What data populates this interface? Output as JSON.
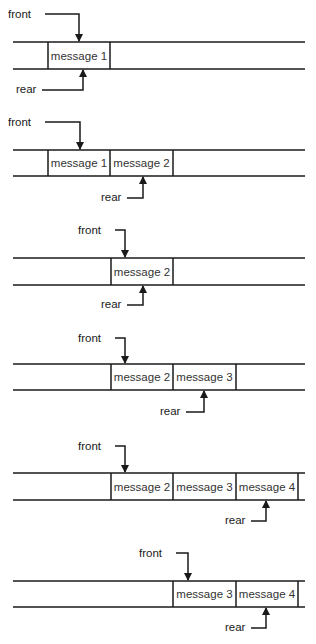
{
  "diagram": {
    "title": "",
    "line_color": "#1a1a1a",
    "labels": {
      "front": "front",
      "rear": "rear"
    },
    "track": {
      "x_start": 13,
      "x_end": 305,
      "cell_width": 62,
      "cells_x": [
        48,
        110,
        173,
        236,
        298
      ]
    },
    "panels": [
      {
        "id": 1,
        "top": 42,
        "bottom": 69,
        "messages": [
          {
            "text": "message 1",
            "x0": 48,
            "x1": 110
          }
        ],
        "front": {
          "label_x": 8,
          "label_y": 18,
          "arrow_x": 79
        },
        "rear": {
          "label_x": 16,
          "label_y": 93,
          "arrow_x": 83
        },
        "right_cap": false
      },
      {
        "id": 2,
        "top": 150,
        "bottom": 176,
        "messages": [
          {
            "text": "message 1",
            "x0": 48,
            "x1": 110
          },
          {
            "text": "message 2",
            "x0": 110,
            "x1": 173
          }
        ],
        "front": {
          "label_x": 8,
          "label_y": 126,
          "arrow_x": 80
        },
        "rear": {
          "label_x": 101,
          "label_y": 201,
          "arrow_x": 143
        },
        "right_cap": false
      },
      {
        "id": 3,
        "top": 258,
        "bottom": 285,
        "messages": [
          {
            "text": "message 2",
            "x0": 111,
            "x1": 173
          }
        ],
        "front": {
          "label_x": 78,
          "label_y": 234,
          "arrow_x": 125
        },
        "rear": {
          "label_x": 101,
          "label_y": 308,
          "arrow_x": 143
        },
        "right_cap": false
      },
      {
        "id": 4,
        "top": 364,
        "bottom": 390,
        "messages": [
          {
            "text": "message 2",
            "x0": 111,
            "x1": 173
          },
          {
            "text": "message 3",
            "x0": 173,
            "x1": 236
          }
        ],
        "front": {
          "label_x": 78,
          "label_y": 342,
          "arrow_x": 125
        },
        "rear": {
          "label_x": 160,
          "label_y": 415,
          "arrow_x": 204
        },
        "right_cap": false
      },
      {
        "id": 5,
        "top": 473,
        "bottom": 500,
        "messages": [
          {
            "text": "message 2",
            "x0": 111,
            "x1": 173
          },
          {
            "text": "message 3",
            "x0": 173,
            "x1": 236
          },
          {
            "text": "message 4",
            "x0": 236,
            "x1": 298
          }
        ],
        "front": {
          "label_x": 78,
          "label_y": 450,
          "arrow_x": 125
        },
        "rear": {
          "label_x": 225,
          "label_y": 524,
          "arrow_x": 266
        },
        "right_cap": true
      },
      {
        "id": 6,
        "top": 581,
        "bottom": 607,
        "messages": [
          {
            "text": "message 3",
            "x0": 173,
            "x1": 236
          },
          {
            "text": "message 4",
            "x0": 236,
            "x1": 298
          }
        ],
        "front": {
          "label_x": 139,
          "label_y": 557,
          "arrow_x": 188
        },
        "rear": {
          "label_x": 225,
          "label_y": 631,
          "arrow_x": 266
        },
        "right_cap": true
      }
    ]
  }
}
